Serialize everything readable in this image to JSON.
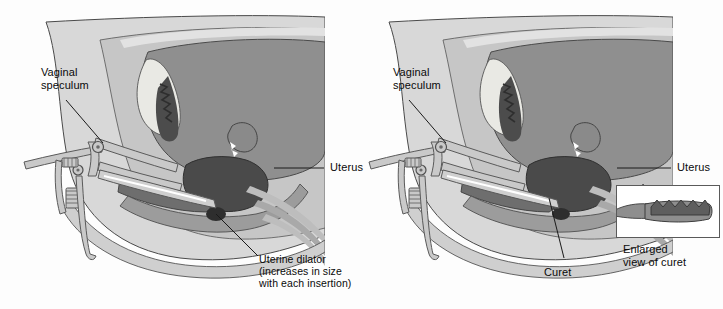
{
  "figure": {
    "background_color": "#fdfdfd",
    "width": 723,
    "height": 309,
    "panel_count": 2
  },
  "palette": {
    "outline": "#3d3d3d",
    "skin_outer": "#d8d8d8",
    "skin_mid": "#c2c2c2",
    "tissue_light": "#b4b4b4",
    "tissue_mid": "#9a9a9a",
    "tissue_dark": "#7e7e7e",
    "organ_dark": "#5d5d5d",
    "organ_darkest": "#3f3f3f",
    "bone_light": "#e8e8e4",
    "highlight": "#efefea",
    "instrument_fill": "#c9c9c9",
    "instrument_stroke": "#5a5a5a",
    "leader_line": "#1a1a1a",
    "inset_border": "#5a5a5a",
    "inset_fill": "#ffffff",
    "curet_fill": "#8e8e8e",
    "curet_head": "#6a6a6a"
  },
  "panels": [
    {
      "id": "panel-dilator",
      "side": "left",
      "labels": {
        "speculum": "Vaginal\nspeculum",
        "uterus": "Uterus",
        "instrument": "Uterine dilator\n(increases in size\nwith each insertion)"
      }
    },
    {
      "id": "panel-curet",
      "side": "right",
      "labels": {
        "speculum": "Vaginal\nspeculum",
        "uterus": "Uterus",
        "instrument": "Curet",
        "inset_caption": "Enlarged\nview of curet"
      }
    }
  ]
}
